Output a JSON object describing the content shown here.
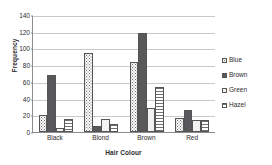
{
  "chart_data": {
    "type": "bar",
    "title": "",
    "xlabel": "Hair Colour",
    "ylabel": "Frequency",
    "categories": [
      "Black",
      "Blond",
      "Brown",
      "Red"
    ],
    "series": [
      {
        "name": "Blue",
        "values": [
          20,
          94,
          84,
          17
        ],
        "pattern": "dotted",
        "color": "#ffffff"
      },
      {
        "name": "Brown",
        "values": [
          68,
          7,
          119,
          26
        ],
        "pattern": "solid-dark",
        "color": "#59595b"
      },
      {
        "name": "Green",
        "values": [
          5,
          16,
          29,
          14
        ],
        "pattern": "plain-light",
        "color": "#f2f2f2"
      },
      {
        "name": "Hazel",
        "values": [
          15,
          10,
          54,
          14
        ],
        "pattern": "horizontal-stripes",
        "color": "#ffffff"
      }
    ],
    "ylim": [
      0,
      140
    ],
    "yticks": [
      0,
      20,
      40,
      60,
      80,
      100,
      120,
      140
    ],
    "grid": true,
    "legend_position": "right"
  }
}
